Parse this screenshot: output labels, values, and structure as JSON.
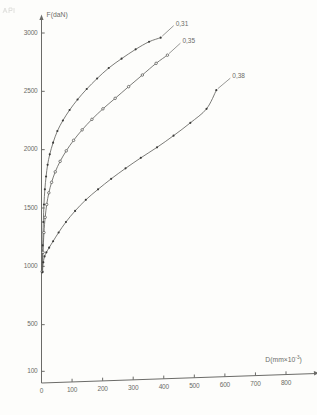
{
  "chart_data": {
    "type": "line",
    "title": "",
    "subtitle": "",
    "ylabel": "F(daN)",
    "xlabel": "D(mm×10",
    "xlabel_exponent": "-3",
    "xlabel_suffix": ")",
    "xlim": [
      0,
      860
    ],
    "ylim": [
      0,
      3150
    ],
    "grid": false,
    "legend_position": "inline-end-of-curve",
    "yticks": [
      100,
      500,
      1000,
      1500,
      2000,
      2500,
      3000
    ],
    "ytick_labels": [
      "100",
      "500",
      "1000",
      "1500",
      "2000",
      "2500",
      "3000"
    ],
    "xticks": [
      0,
      100,
      200,
      300,
      400,
      500,
      600,
      700,
      800
    ],
    "xtick_labels": [
      "0",
      "100",
      "200",
      "300",
      "400",
      "500",
      "600",
      "700",
      "800"
    ],
    "origin_label": "0",
    "marker_styles": [
      "filled-dot",
      "open-circle",
      "filled-dot"
    ],
    "series": [
      {
        "name": "0,31",
        "label": "0,31",
        "marker": "filled-dot",
        "x": [
          2,
          4,
          6,
          8,
          11,
          15,
          20,
          27,
          38,
          52,
          70,
          92,
          118,
          148,
          182,
          220,
          262,
          308,
          352,
          390
        ],
        "y": [
          960,
          1180,
          1380,
          1530,
          1660,
          1770,
          1870,
          1960,
          2060,
          2160,
          2250,
          2340,
          2430,
          2520,
          2610,
          2700,
          2780,
          2860,
          2925,
          2960
        ]
      },
      {
        "name": "0,35",
        "label": "0,35",
        "marker": "open-circle",
        "x": [
          2,
          5,
          8,
          12,
          17,
          24,
          33,
          45,
          61,
          81,
          105,
          133,
          165,
          201,
          241,
          285,
          330,
          375,
          412
        ],
        "y": [
          955,
          1120,
          1290,
          1420,
          1530,
          1630,
          1720,
          1810,
          1900,
          1990,
          2080,
          2170,
          2260,
          2350,
          2440,
          2540,
          2640,
          2740,
          2810
        ]
      },
      {
        "name": "0,38",
        "label": "0,38",
        "marker": "filled-dot",
        "x": [
          3,
          6,
          10,
          16,
          25,
          38,
          56,
          80,
          110,
          145,
          185,
          228,
          275,
          325,
          378,
          432,
          487,
          540,
          572
        ],
        "y": [
          950,
          1035,
          1085,
          1120,
          1160,
          1215,
          1290,
          1380,
          1475,
          1570,
          1660,
          1750,
          1840,
          1930,
          2020,
          2120,
          2230,
          2350,
          2510
        ]
      }
    ]
  }
}
